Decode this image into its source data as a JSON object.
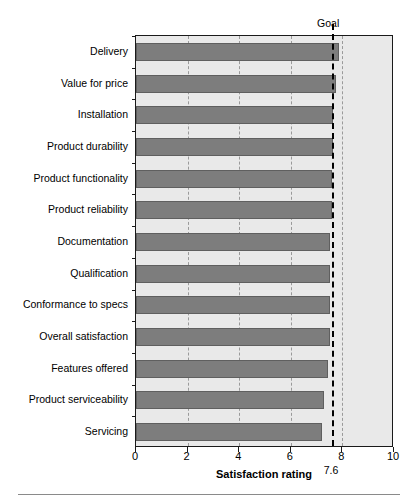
{
  "chart_data": {
    "type": "bar",
    "orientation": "horizontal",
    "title": "",
    "xlabel": "Satisfaction rating",
    "ylabel": "",
    "xlim": [
      0,
      10
    ],
    "xticks": [
      0,
      2,
      4,
      6,
      8,
      10
    ],
    "xtick_labels": [
      "0",
      "2",
      "4",
      "6",
      "8",
      "10"
    ],
    "grid": "vertical-dashed-at-xticks",
    "legend": "none",
    "categories": [
      "Delivery",
      "Value for price",
      "Installation",
      "Product durability",
      "Product functionality",
      "Product reliability",
      "Documentation",
      "Qualification",
      "Conformance to specs",
      "Overall satisfaction",
      "Features offered",
      "Product serviceability",
      "Servicing"
    ],
    "values": [
      7.85,
      7.75,
      7.65,
      7.65,
      7.6,
      7.6,
      7.5,
      7.5,
      7.5,
      7.5,
      7.45,
      7.3,
      7.2
    ],
    "annotations": [
      {
        "name": "goal-line",
        "label": "Goal",
        "value": 7.6,
        "value_label": "7.6",
        "style": "dashed-vertical-black"
      }
    ],
    "colors": {
      "bar_fill": "#7d7d7d",
      "bar_edge": "#5f5f5f",
      "plot_background": "#e9e9e9",
      "axis": "#1a1a1a",
      "gridline": "#9a9a9a",
      "goal_line": "#000000",
      "text": "#000000"
    }
  }
}
